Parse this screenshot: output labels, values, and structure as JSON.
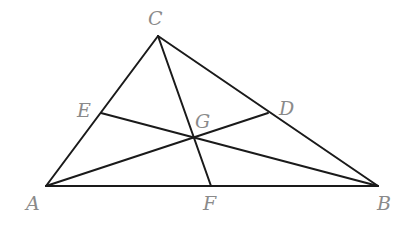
{
  "figure": {
    "type": "triangle-medians",
    "background": "#ffffff",
    "line_color": "#1a1a1a",
    "label_color": "#8a8a8a",
    "points": {
      "A": {
        "x": 46,
        "y": 186
      },
      "B": {
        "x": 378,
        "y": 186
      },
      "C": {
        "x": 158,
        "y": 36
      },
      "D": {
        "x": 268,
        "y": 113
      },
      "E": {
        "x": 101,
        "y": 113
      },
      "F": {
        "x": 211,
        "y": 186
      },
      "G": {
        "x": 193,
        "y": 137
      }
    },
    "segments": [
      [
        "A",
        "B"
      ],
      [
        "B",
        "C"
      ],
      [
        "C",
        "A"
      ],
      [
        "A",
        "D"
      ],
      [
        "B",
        "E"
      ],
      [
        "C",
        "F"
      ]
    ],
    "labels": [
      {
        "text": "C",
        "x": 148,
        "y": 25
      },
      {
        "text": "E",
        "x": 77,
        "y": 117
      },
      {
        "text": "D",
        "x": 279,
        "y": 115
      },
      {
        "text": "G",
        "x": 195,
        "y": 128
      },
      {
        "text": "A",
        "x": 26,
        "y": 210
      },
      {
        "text": "F",
        "x": 203,
        "y": 210
      },
      {
        "text": "B",
        "x": 377,
        "y": 210
      }
    ]
  }
}
